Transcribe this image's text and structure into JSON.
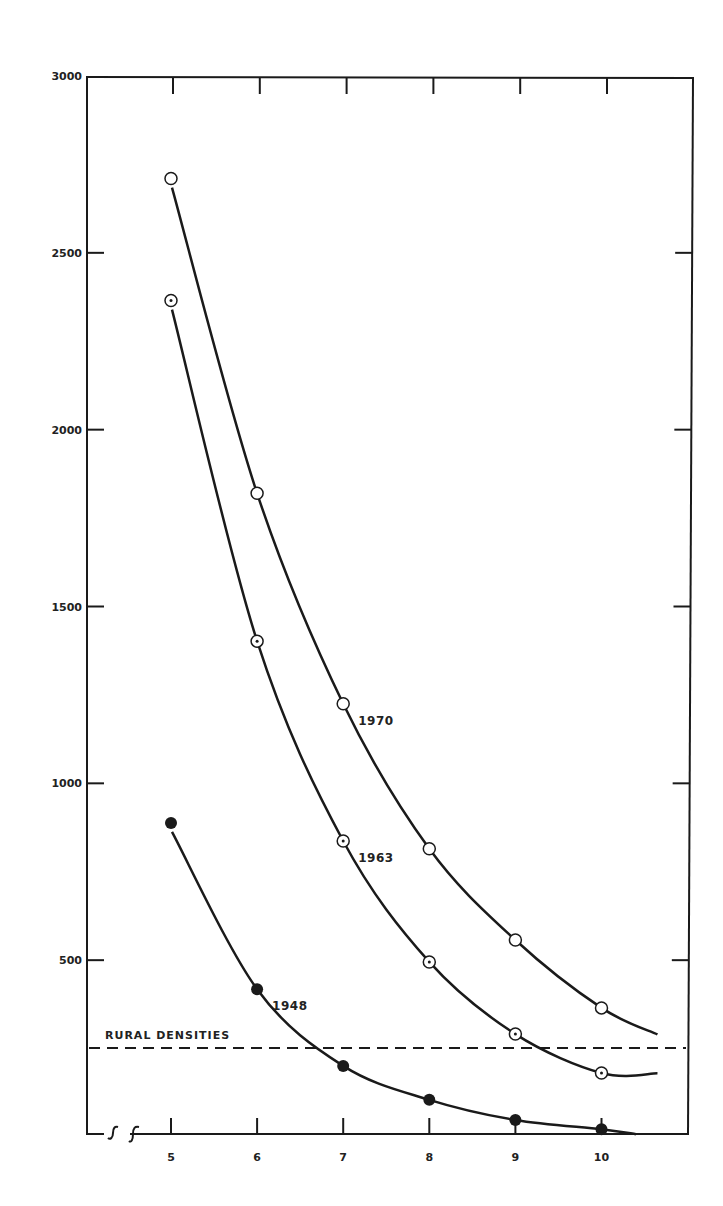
{
  "chart_data": {
    "type": "line",
    "title": "",
    "xlabel": "",
    "ylabel": "",
    "x": [
      5,
      6,
      7,
      8,
      9,
      10
    ],
    "x_tick_labels": [
      "5",
      "6",
      "7",
      "8",
      "9",
      "10"
    ],
    "y_tick_labels": [
      "500",
      "1000",
      "1500",
      "2000",
      "2500",
      "3000"
    ],
    "y_ticks": [
      500,
      1000,
      1500,
      2000,
      2500,
      3000
    ],
    "ylim": [
      0,
      3000
    ],
    "xlim": [
      3.9,
      11
    ],
    "x_axis_break": true,
    "grid": false,
    "legend": "inline labels next to curves",
    "series": [
      {
        "name": "1970",
        "marker": "open-circle",
        "values": [
          2710,
          1820,
          1225,
          815,
          557,
          365
        ],
        "curve_end": [
          10.65,
          290
        ]
      },
      {
        "name": "1963",
        "marker": "dotted-circle",
        "values": [
          2365,
          1402,
          837,
          495,
          291,
          181
        ],
        "curve_end": [
          10.65,
          180
        ]
      },
      {
        "name": "1948",
        "marker": "filled-circle",
        "values": [
          888,
          418,
          201,
          105,
          48,
          22
        ],
        "curve_end": [
          10.4,
          8
        ]
      }
    ],
    "reference_lines": [
      {
        "label": "RURAL DENSITIES",
        "y": 252,
        "style": "dashed"
      }
    ],
    "annotations": [
      {
        "text": "1970",
        "near": [
          7,
          1225
        ]
      },
      {
        "text": "1963",
        "near": [
          7,
          837
        ]
      },
      {
        "text": "1948",
        "near": [
          6,
          418
        ]
      }
    ]
  },
  "colors": {
    "ink": "#1a1a1a",
    "background": "#ffffff"
  }
}
